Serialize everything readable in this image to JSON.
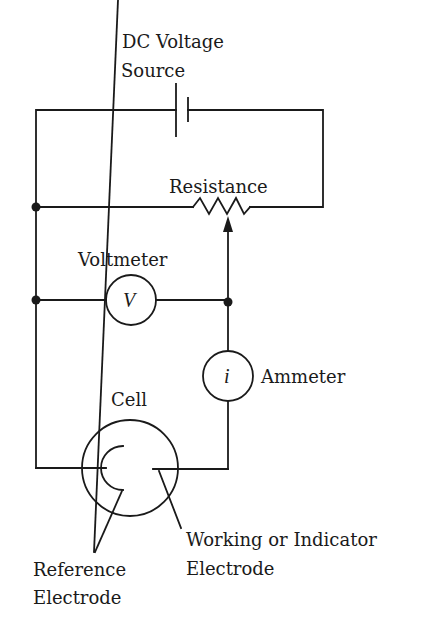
{
  "diagram": {
    "type": "electrochemical cell measurement circuit",
    "labels": {
      "dc_source_line1": "DC Voltage",
      "dc_source_line2": "Source",
      "resistance": "Resistance",
      "voltmeter": "Voltmeter",
      "voltmeter_symbol": "V",
      "ammeter": "Ammeter",
      "ammeter_symbol": "i",
      "cell": "Cell",
      "reference_line1": "Reference",
      "reference_line2": "Electrode",
      "working_line1": "Working or Indicator",
      "working_line2": "Electrode"
    },
    "components": [
      {
        "id": "dc-voltage-source",
        "label": "DC Voltage Source"
      },
      {
        "id": "variable-resistance",
        "label": "Resistance"
      },
      {
        "id": "voltmeter",
        "label": "Voltmeter",
        "symbol": "V"
      },
      {
        "id": "ammeter",
        "label": "Ammeter",
        "symbol": "i"
      },
      {
        "id": "cell",
        "label": "Cell"
      },
      {
        "id": "reference-electrode",
        "label": "Reference Electrode"
      },
      {
        "id": "working-electrode",
        "label": "Working or Indicator Electrode"
      }
    ],
    "colors": {
      "ink": "#1a1a1a",
      "background": "#ffffff"
    }
  }
}
